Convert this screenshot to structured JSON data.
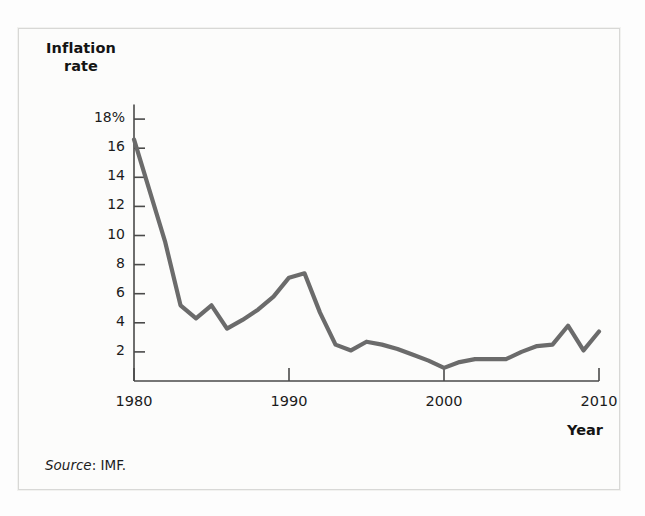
{
  "figure": {
    "source_prefix": "Source",
    "source_text": ": IMF.",
    "frame_color": "#d8d8d6",
    "background_color": "#fcfcfb"
  },
  "chart_data": {
    "type": "line",
    "title": "",
    "subtitle": "",
    "xlabel": "Year",
    "ylabel": "Inflation rate",
    "ylabel_lines": [
      "Inflation",
      "rate"
    ],
    "line_color": "#6b6b6b",
    "axis_color": "#4a4a4a",
    "grid": false,
    "legend": null,
    "xlim": [
      1980,
      2010
    ],
    "ylim": [
      0,
      19
    ],
    "xticks": [
      1980,
      1990,
      2000,
      2010
    ],
    "xtick_labels": [
      "1980",
      "1990",
      "2000",
      "2010"
    ],
    "yticks": [
      2,
      4,
      6,
      8,
      10,
      12,
      14,
      16,
      18
    ],
    "ytick_labels": [
      "2",
      "4",
      "6",
      "8",
      "10",
      "12",
      "14",
      "16",
      "18%"
    ],
    "series": [
      {
        "name": "Inflation rate",
        "x": [
          1980,
          1981,
          1982,
          1983,
          1984,
          1985,
          1986,
          1987,
          1988,
          1989,
          1990,
          1991,
          1992,
          1993,
          1994,
          1995,
          1996,
          1997,
          1998,
          1999,
          2000,
          2001,
          2002,
          2003,
          2004,
          2005,
          2006,
          2007,
          2008,
          2009,
          2010
        ],
        "values": [
          16.6,
          13.1,
          9.6,
          5.2,
          4.3,
          5.2,
          3.6,
          4.2,
          4.9,
          5.8,
          7.1,
          7.4,
          4.7,
          2.5,
          2.1,
          2.7,
          2.5,
          2.2,
          1.8,
          1.4,
          0.9,
          1.3,
          1.5,
          1.5,
          1.5,
          2.0,
          2.4,
          2.5,
          3.8,
          2.1,
          3.4
        ]
      }
    ],
    "annotations": []
  }
}
